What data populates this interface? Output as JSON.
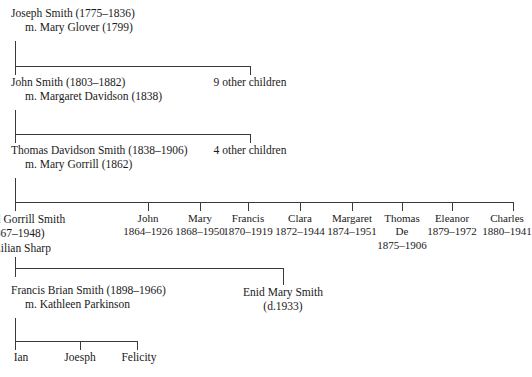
{
  "diagram": {
    "type": "family-tree",
    "generations": [
      {
        "id": "gen1",
        "name_line": "Joseph Smith (1775–1836)",
        "marriage_line": "m. Mary Glover (1799)"
      },
      {
        "id": "gen2",
        "name_line": "John Smith (1803–1882)",
        "marriage_line": "m. Margaret Davidson (1838)"
      },
      {
        "id": "gen3",
        "name_line": "Thomas Davidson Smith (1838–1906)",
        "marriage_line": "m. Mary Gorrill (1862)"
      },
      {
        "id": "gen4",
        "name_line": "Edward Gorrill Smith",
        "dates_line": "(1867–1948)",
        "marriage_line": "m. Lilian Sharp"
      },
      {
        "id": "gen5",
        "name_line": "Francis Brian Smith (1898–1966)",
        "marriage_line": "m. Kathleen Parkinson"
      }
    ],
    "other_children": [
      {
        "id": "other-gen2",
        "label": "9 other children"
      },
      {
        "id": "other-gen3",
        "label": "4 other children"
      }
    ],
    "siblings": [
      {
        "name": "John",
        "dates": "1864–1926"
      },
      {
        "name": "Mary",
        "dates": "1868–1950"
      },
      {
        "name": "Francis",
        "dates": "1870–1919"
      },
      {
        "name": "Clara",
        "dates": "1872–1944"
      },
      {
        "name": "Margaret",
        "dates": "1874–1951"
      },
      {
        "name": "Thomas",
        "name2": "De",
        "dates": "1875–1906"
      },
      {
        "name": "Eleanor",
        "dates": "1879–1972"
      },
      {
        "name": "Charles",
        "dates": "1880–1941"
      }
    ],
    "sibling_branch": {
      "name_line": "Enid Mary Smith",
      "dates_line": "(d.1933)"
    },
    "children": [
      {
        "label": "Ian"
      },
      {
        "label": "Joesph"
      },
      {
        "label": "Felicity"
      }
    ],
    "caption": "",
    "colors": {
      "line": "#3a3a3a",
      "text": "#1a1a1a",
      "background": "#ffffff"
    }
  }
}
